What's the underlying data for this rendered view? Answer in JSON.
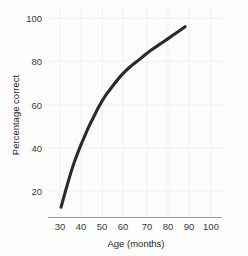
{
  "chart_data": {
    "type": "line",
    "title": "",
    "subtitle": "",
    "xlabel": "Age (months)",
    "ylabel": "Percentage correct",
    "xlim": [
      25,
      105
    ],
    "ylim": [
      5,
      105
    ],
    "xticks": [
      30,
      40,
      50,
      60,
      70,
      80,
      90,
      100
    ],
    "xtick_labels": [
      "30",
      "40",
      "50",
      "60",
      "70",
      "80",
      "90",
      "100"
    ],
    "yticks": [
      20,
      40,
      60,
      80,
      100
    ],
    "ytick_labels": [
      "20",
      "40",
      "60",
      "80",
      "100"
    ],
    "grid": true,
    "legend": null,
    "series": [
      {
        "name": "Percentage correct",
        "color": "#2b2b2b",
        "x": [
          30.5,
          32,
          34,
          36,
          38,
          40,
          43,
          46,
          48,
          51,
          54,
          58,
          62,
          67,
          72,
          78,
          83,
          88
        ],
        "y": [
          12.5,
          18,
          25,
          31.5,
          37,
          42,
          49,
          55,
          59,
          64,
          68,
          73,
          77,
          81,
          85,
          89,
          92.5,
          96
        ]
      }
    ],
    "annotations": []
  },
  "axes": {
    "y_title": "Percentage correct",
    "x_title": "Age (months)",
    "y_tick_1": "20",
    "y_tick_2": "40",
    "y_tick_3": "60",
    "y_tick_4": "80",
    "y_tick_5": "100",
    "x_tick_1": "30",
    "x_tick_2": "40",
    "x_tick_3": "50",
    "x_tick_4": "60",
    "x_tick_5": "70",
    "x_tick_6": "80",
    "x_tick_7": "90",
    "x_tick_8": "100"
  },
  "colors": {
    "curve": "#2b2b2b",
    "axis": "#9a9a9a",
    "grid": "#f0f0f0",
    "background": "#fdfdfd",
    "text": "#231f20"
  }
}
